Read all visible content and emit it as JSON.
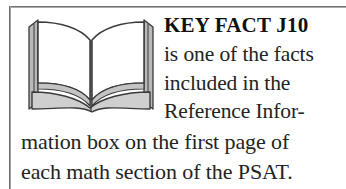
{
  "callout": {
    "kind": "key-fact-callout",
    "icon": {
      "name": "open-book-icon",
      "description": "open book"
    },
    "title": "KEY FACT J10",
    "body_lines_indented": [
      "is one of the facts",
      "included in the",
      "Reference Infor-"
    ],
    "body_lines_full": [
      "mation box on the first page of",
      "each math section of the PSAT."
    ],
    "full_text": "KEY FACT J10 is one of the facts included in the Reference Information box on the first page of each math section of the PSAT.",
    "colors": {
      "page_background": "#ffffff",
      "text": "#232323",
      "title_text": "#101010",
      "rule": "#5d5d5d",
      "book_outline": "#3a3a3a",
      "book_shade": "#b9b9b9",
      "book_page": "#ffffff"
    }
  }
}
